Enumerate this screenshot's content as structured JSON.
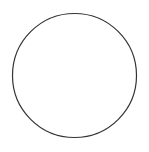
{
  "figure": {
    "title": "Circle divided into twelve equal sectors",
    "type": "circle-fraction-diagram",
    "background_color": "#ffffff",
    "stroke_color": "#3a3a3a",
    "outline_stroke_color": "#333333",
    "stroke_width": 1,
    "outline_stroke_width": 1.2,
    "canvas": {
      "width": 149,
      "height": 152
    },
    "circle": {
      "center_x": 74.5,
      "center_y": 75.5,
      "radius": 62
    },
    "sectors": {
      "count": 12,
      "angle_degrees": 30,
      "fraction_each": "1/12",
      "shaded_count": 0
    },
    "diameters": {
      "count": 6,
      "angles_degrees": [
        0,
        30,
        60,
        90,
        120,
        150
      ]
    },
    "spoke_endpoints_degrees": [
      0,
      30,
      60,
      90,
      120,
      150,
      180,
      210,
      240,
      270,
      300,
      330
    ],
    "labels": []
  }
}
